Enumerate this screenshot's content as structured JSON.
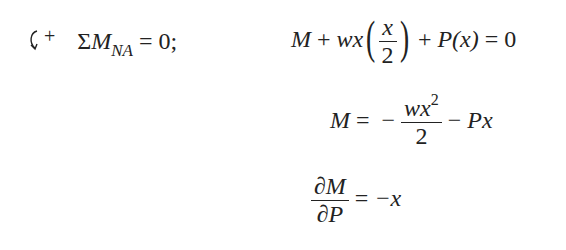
{
  "equations": {
    "sum_moments": {
      "icon": "counterclockwise-moment-arrow-icon",
      "sign": "+",
      "sigma": "Σ",
      "symbol": "M",
      "subscript": "NA",
      "rhs": "= 0;"
    },
    "line1": {
      "M": "M",
      "plus1": "+",
      "wx": "wx",
      "frac_num": "x",
      "frac_den": "2",
      "plus2": "+",
      "P": "P",
      "arg": "(x)",
      "rhs": "= 0"
    },
    "line2": {
      "M": "M",
      "eq": "=",
      "minus1": "−",
      "frac_num": "wx",
      "frac_num_exp": "2",
      "frac_den": "2",
      "minus2": "−",
      "Px": "Px"
    },
    "line3": {
      "frac_num": "∂M",
      "frac_den": "∂P",
      "rhs_eq": "=",
      "rhs_val": "−x"
    }
  }
}
